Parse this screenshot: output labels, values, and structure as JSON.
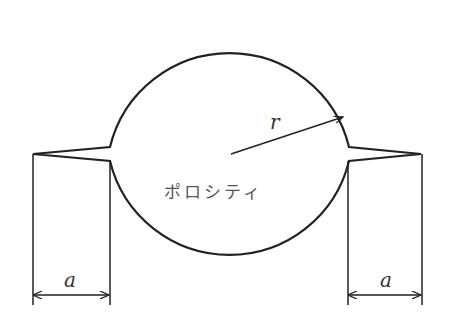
{
  "diagram": {
    "labels": {
      "center_text": "ポロシティ",
      "radius": "r",
      "left_width": "a",
      "right_width": "a"
    },
    "colors": {
      "stroke": "#222222",
      "background": "#ffffff"
    }
  }
}
